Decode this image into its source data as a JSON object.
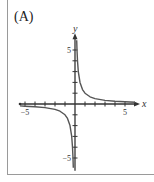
{
  "panel": {
    "label": "(A)"
  },
  "chart_data": {
    "type": "line",
    "title": "(A)",
    "function": "y = 1/x",
    "xlabel": "x",
    "ylabel": "y",
    "xlim": [
      -5.5,
      6
    ],
    "ylim": [
      -6,
      6
    ],
    "x_tick_labels": [
      "-5",
      "5"
    ],
    "y_tick_labels": [
      "5",
      "-5"
    ],
    "x_ticks": [
      -5,
      -4,
      -3,
      -2,
      -1,
      1,
      2,
      3,
      4,
      5
    ],
    "y_ticks": [
      -5,
      -4,
      -3,
      -2,
      -1,
      1,
      2,
      3,
      4,
      5
    ],
    "grid": false,
    "series": [
      {
        "name": "branch-positive",
        "x": [
          0.17,
          0.2,
          0.25,
          0.33,
          0.5,
          0.75,
          1,
          1.5,
          2,
          3,
          4,
          5,
          6
        ],
        "y": [
          5.9,
          5,
          4,
          3,
          2,
          1.33,
          1,
          0.67,
          0.5,
          0.33,
          0.25,
          0.2,
          0.17
        ]
      },
      {
        "name": "branch-negative",
        "x": [
          -5.5,
          -5,
          -4,
          -3,
          -2,
          -1.5,
          -1,
          -0.75,
          -0.5,
          -0.33,
          -0.25,
          -0.2,
          -0.17
        ],
        "y": [
          -0.18,
          -0.2,
          -0.25,
          -0.33,
          -0.5,
          -0.67,
          -1,
          -1.33,
          -2,
          -3,
          -4,
          -5,
          -5.9
        ]
      }
    ],
    "colors": {
      "axis": "#333333",
      "curve": "#555555"
    }
  }
}
